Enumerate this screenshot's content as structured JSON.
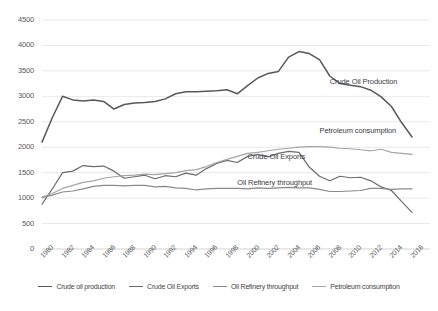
{
  "chart_data": {
    "type": "line",
    "title": "",
    "subtitle": "",
    "xlabel": "",
    "ylabel": "",
    "grid": true,
    "legend_position": "bottom",
    "ylim": [
      0,
      4500
    ],
    "yticks": [
      0,
      500,
      1000,
      1500,
      2000,
      2500,
      3000,
      3500,
      4000,
      4500
    ],
    "xlim": [
      1980,
      2016
    ],
    "xticks": [
      1980,
      1982,
      1984,
      1986,
      1988,
      1990,
      1992,
      1994,
      1996,
      1998,
      2000,
      2002,
      2004,
      2006,
      2008,
      2010,
      2012,
      2014,
      2016
    ],
    "x": [
      1980,
      1981,
      1982,
      1983,
      1984,
      1985,
      1986,
      1987,
      1988,
      1989,
      1990,
      1991,
      1992,
      1993,
      1994,
      1995,
      1996,
      1997,
      1998,
      1999,
      2000,
      2001,
      2002,
      2003,
      2004,
      2005,
      2006,
      2007,
      2008,
      2009,
      2010,
      2011,
      2012,
      2013,
      2014,
      2015,
      2016
    ],
    "series": [
      {
        "name": "Crude oil production",
        "color": "#58585a",
        "values": [
          2100,
          2580,
          3000,
          2930,
          2910,
          2930,
          2900,
          2750,
          2840,
          2870,
          2880,
          2900,
          2950,
          3050,
          3090,
          3090,
          3100,
          3110,
          3130,
          3050,
          3210,
          3360,
          3450,
          3490,
          3770,
          3880,
          3840,
          3720,
          3400,
          3250,
          3220,
          3190,
          3120,
          2990,
          2800,
          2480,
          2200
        ]
      },
      {
        "name": "Crude Oil Exports",
        "color": "#6b6b6d",
        "values": [
          880,
          1180,
          1500,
          1530,
          1640,
          1620,
          1630,
          1530,
          1390,
          1420,
          1450,
          1380,
          1440,
          1420,
          1490,
          1450,
          1580,
          1680,
          1740,
          1700,
          1820,
          1860,
          1810,
          1880,
          1920,
          1900,
          1610,
          1430,
          1340,
          1430,
          1400,
          1410,
          1340,
          1220,
          1150,
          930,
          720
        ]
      },
      {
        "name": "Oil Refinery throughput",
        "color": "#8a8a8c",
        "values": [
          1010,
          1060,
          1120,
          1140,
          1180,
          1230,
          1250,
          1250,
          1240,
          1250,
          1250,
          1220,
          1230,
          1200,
          1190,
          1160,
          1180,
          1190,
          1190,
          1190,
          1180,
          1200,
          1190,
          1200,
          1210,
          1200,
          1200,
          1170,
          1130,
          1130,
          1140,
          1150,
          1190,
          1190,
          1170,
          1180,
          1180
        ]
      },
      {
        "name": "Petroleum consumption",
        "color": "#a5a5a7",
        "values": [
          1020,
          1090,
          1190,
          1250,
          1310,
          1340,
          1390,
          1420,
          1440,
          1450,
          1470,
          1460,
          1480,
          1500,
          1540,
          1560,
          1620,
          1700,
          1760,
          1820,
          1880,
          1900,
          1930,
          1960,
          1980,
          2000,
          2010,
          2010,
          2000,
          1980,
          1970,
          1950,
          1930,
          1960,
          1900,
          1880,
          1860
        ]
      }
    ],
    "annotations": [
      {
        "text": "Crude Oil Production",
        "x": 2008,
        "y": 3280
      },
      {
        "text": "Petroleum consumption",
        "x": 2007,
        "y": 2320
      },
      {
        "text": "Crude Oil Exports",
        "x": 2000,
        "y": 1810
      },
      {
        "text": "Oil Refinery throughput",
        "x": 1999,
        "y": 1290
      }
    ]
  },
  "legend": {
    "items": [
      {
        "label": "Crude oil production",
        "color": "#58585a"
      },
      {
        "label": "Crude Oil Exports",
        "color": "#6b6b6d"
      },
      {
        "label": "Oil Refinery throughput",
        "color": "#8a8a8c"
      },
      {
        "label": "Petroleum consumption",
        "color": "#a5a5a7"
      }
    ]
  },
  "axes": {
    "y_tick_labels": [
      "4500",
      "4000",
      "3500",
      "3000",
      "2500",
      "2000",
      "1500",
      "1000",
      "500",
      "0"
    ],
    "x_tick_labels": [
      "1980",
      "1982",
      "1984",
      "1986",
      "1988",
      "1990",
      "1992",
      "1994",
      "1996",
      "1998",
      "2000",
      "2002",
      "2004",
      "2006",
      "2008",
      "2010",
      "2012",
      "2014",
      "2016"
    ]
  }
}
